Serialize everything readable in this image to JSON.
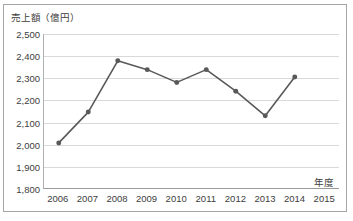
{
  "chart_data": {
    "type": "line",
    "title": "",
    "ylabel": "売上額（億円）",
    "xlabel": "年度",
    "categories": [
      "2006",
      "2007",
      "2008",
      "2009",
      "2010",
      "2011",
      "2012",
      "2013",
      "2014",
      "2015"
    ],
    "values": [
      2005,
      2145,
      2378,
      2338,
      2280,
      2338,
      2240,
      2128,
      2305,
      null
    ],
    "series": [
      {
        "name": "売上額",
        "values": [
          2005,
          2145,
          2378,
          2338,
          2280,
          2338,
          2240,
          2128,
          2305,
          null
        ]
      }
    ],
    "ylim": [
      1800,
      2500
    ],
    "y_ticks": [
      2500,
      2400,
      2300,
      2200,
      2100,
      2000,
      1900,
      1800
    ],
    "y_tick_labels": [
      "2,500",
      "2,400",
      "2,300",
      "2,200",
      "2,100",
      "2,000",
      "1,900",
      "1,800"
    ],
    "grid": true,
    "legend": false,
    "legend_position": "none",
    "series_color": "#595959",
    "grid_color": "#d9d9d9",
    "axis_color": "#9a9a9a",
    "marker": "circle",
    "annotations": []
  }
}
